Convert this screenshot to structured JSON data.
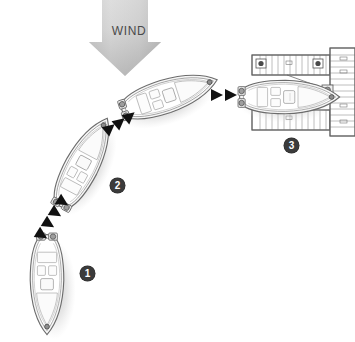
{
  "diagram": {
    "background_color": "#ffffff",
    "wind": {
      "label": "WIND",
      "direction": "down",
      "arrow_color_top": "#d8d8d8",
      "arrow_color_bottom": "#9b9b9b",
      "label_color": "#4a4a4a"
    },
    "steps": [
      {
        "id": "1",
        "label": "1",
        "description": "Boat approaching upwind, bow pointing up"
      },
      {
        "id": "2",
        "label": "2",
        "description": "Boat turning, angled toward slip"
      },
      {
        "id": "3",
        "label": "3",
        "description": "Boat docked in slip alongside pier"
      }
    ],
    "boats": [
      {
        "name": "boat-step-1",
        "heading": "north",
        "rotation_deg": 0
      },
      {
        "name": "boat-step-2",
        "heading": "north-east",
        "rotation_deg": 28
      },
      {
        "name": "boat-step-3",
        "heading": "east-north-east",
        "rotation_deg": 72
      },
      {
        "name": "boat-docked",
        "heading": "east",
        "rotation_deg": 90
      }
    ],
    "path_arrows": [
      {
        "name": "path-arrows-1-to-2",
        "count": 4,
        "angle_deg": -58
      },
      {
        "name": "path-arrows-2-to-3",
        "count": 3,
        "angle_deg": -38
      },
      {
        "name": "path-arrows-3-to-dock",
        "count": 2,
        "angle_deg": 0
      }
    ],
    "dock": {
      "name": "dock-structure",
      "finger_piers": 2,
      "main_pier": 1,
      "pier_color": "#ffffff",
      "pier_outline": "#777777",
      "cleat_count": 4
    },
    "colors": {
      "hull_outline": "#6e6e6e",
      "hull_fill": "#f4f4f4",
      "shadow": "#cfcfcf",
      "arrow_black": "#111111"
    }
  }
}
